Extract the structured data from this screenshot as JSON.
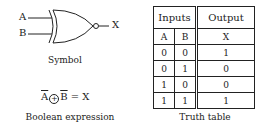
{
  "symbol": {
    "input_a": "A",
    "input_b": "B",
    "output": "X",
    "caption": "Symbol",
    "gate_type": "XNOR"
  },
  "expression": {
    "left_a": "A",
    "operator": "+",
    "left_b": "B",
    "equals": "= X",
    "caption": "Boolean expression"
  },
  "truth_table": {
    "group_headers": [
      "Inputs",
      "Output"
    ],
    "columns": [
      "A",
      "B",
      "X"
    ],
    "rows": [
      [
        "0",
        "0",
        "1"
      ],
      [
        "0",
        "1",
        "0"
      ],
      [
        "1",
        "0",
        "0"
      ],
      [
        "1",
        "1",
        "1"
      ]
    ],
    "caption": "Truth table"
  }
}
